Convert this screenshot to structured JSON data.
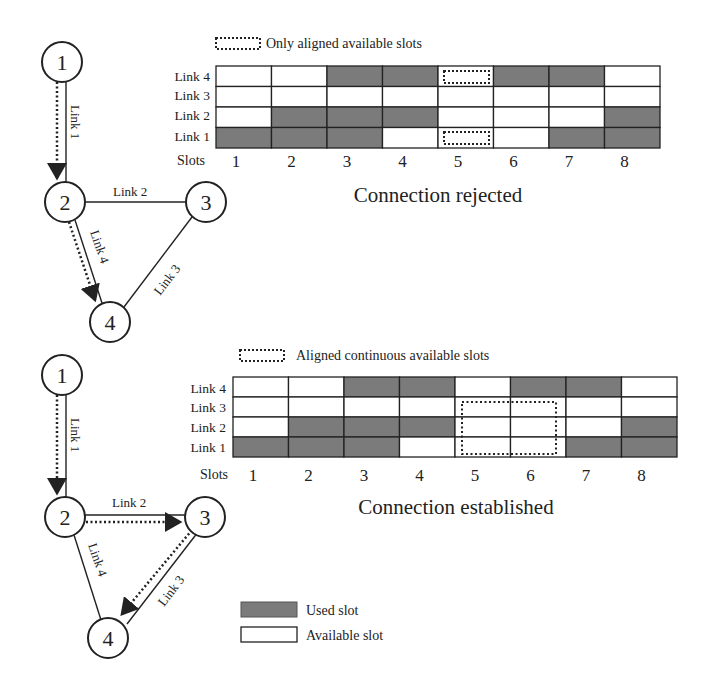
{
  "colors": {
    "used": "#7b7b7b",
    "available": "#ffffff",
    "line": "#222222"
  },
  "panels": [
    {
      "id": "top",
      "legend_label": "Only aligned available slots",
      "caption": "Connection rejected",
      "row_labels": [
        "Link 4",
        "Link 3",
        "Link 2",
        "Link 1"
      ],
      "slots_label": "Slots",
      "slot_numbers": [
        "1",
        "2",
        "3",
        "4",
        "5",
        "6",
        "7",
        "8"
      ],
      "grid": [
        [
          0,
          0,
          1,
          1,
          0,
          1,
          1,
          0
        ],
        [
          0,
          0,
          0,
          0,
          0,
          0,
          0,
          0
        ],
        [
          0,
          1,
          1,
          1,
          0,
          0,
          0,
          1
        ],
        [
          1,
          1,
          1,
          0,
          0,
          0,
          1,
          1
        ]
      ],
      "nodes": [
        "1",
        "2",
        "3",
        "4"
      ],
      "link_labels": [
        "Link 1",
        "Link 2",
        "Link 3",
        "Link 4"
      ]
    },
    {
      "id": "bottom",
      "legend_label": "Aligned continuous available slots",
      "caption": "Connection established",
      "row_labels": [
        "Link 4",
        "Link 3",
        "Link 2",
        "Link 1"
      ],
      "slots_label": "Slots",
      "slot_numbers": [
        "1",
        "2",
        "3",
        "4",
        "5",
        "6",
        "7",
        "8"
      ],
      "grid": [
        [
          0,
          0,
          1,
          1,
          0,
          1,
          1,
          0
        ],
        [
          0,
          0,
          0,
          0,
          0,
          0,
          0,
          0
        ],
        [
          0,
          1,
          1,
          1,
          0,
          0,
          0,
          1
        ],
        [
          1,
          1,
          1,
          0,
          0,
          0,
          1,
          1
        ]
      ],
      "nodes": [
        "1",
        "2",
        "3",
        "4"
      ],
      "link_labels": [
        "Link 1",
        "Link 2",
        "Link 3",
        "Link 4"
      ]
    }
  ],
  "legend": {
    "used_label": "Used slot",
    "available_label": "Available slot"
  }
}
